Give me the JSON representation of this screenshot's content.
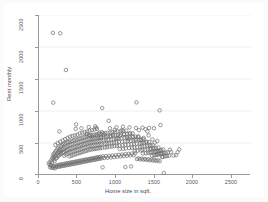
{
  "chart_data": {
    "type": "scatter",
    "title": "",
    "xlabel": "Home size in sqft.",
    "ylabel": "Rent monthly",
    "xlim": [
      0,
      2600
    ],
    "ylim": [
      0,
      2500
    ],
    "xticks": [
      0,
      500,
      1000,
      1500,
      2000,
      2500
    ],
    "yticks": [
      0,
      500,
      1000,
      1500,
      2000,
      2500
    ],
    "xtick_labels": [
      "0",
      "500",
      "1000",
      "1500",
      "2000",
      "2500"
    ],
    "ytick_labels": [
      "0",
      "500",
      "1000",
      "1500",
      "2000",
      "2500"
    ],
    "grid": "horizontal",
    "legend": "none",
    "marker": "open-circle",
    "marker_color": "#6d6d6d",
    "background_color": "#ffffff",
    "axis_color": "#9a9a9a",
    "grid_color": "#e8e8e8",
    "n_points": 432,
    "points": [
      [
        170,
        2220
      ],
      [
        260,
        2215
      ],
      [
        330,
        1640
      ],
      [
        175,
        1130
      ],
      [
        775,
        1045
      ],
      [
        1195,
        1135
      ],
      [
        1480,
        1010
      ],
      [
        1490,
        780
      ],
      [
        455,
        790
      ],
      [
        700,
        740
      ],
      [
        855,
        845
      ],
      [
        930,
        705
      ],
      [
        1015,
        700
      ],
      [
        1120,
        655
      ],
      [
        1225,
        700
      ],
      [
        1305,
        715
      ],
      [
        1330,
        680
      ],
      [
        1345,
        620
      ],
      [
        585,
        640
      ],
      [
        620,
        620
      ],
      [
        650,
        600
      ],
      [
        705,
        615
      ],
      [
        760,
        585
      ],
      [
        800,
        625
      ],
      [
        870,
        600
      ],
      [
        905,
        630
      ],
      [
        960,
        575
      ],
      [
        995,
        610
      ],
      [
        1040,
        640
      ],
      [
        1075,
        590
      ],
      [
        1100,
        560
      ],
      [
        1145,
        600
      ],
      [
        1180,
        555
      ],
      [
        1215,
        590
      ],
      [
        1250,
        545
      ],
      [
        1285,
        580
      ],
      [
        1320,
        520
      ],
      [
        1390,
        555
      ],
      [
        1420,
        505
      ],
      [
        1450,
        530
      ],
      [
        1525,
        400
      ],
      [
        1605,
        395
      ],
      [
        1720,
        400
      ],
      [
        1530,
        30
      ],
      [
        780,
        120
      ],
      [
        1060,
        125
      ],
      [
        1130,
        135
      ],
      [
        120,
        175
      ],
      [
        130,
        200
      ],
      [
        140,
        160
      ],
      [
        150,
        230
      ],
      [
        160,
        195
      ],
      [
        165,
        265
      ],
      [
        170,
        300
      ],
      [
        175,
        240
      ],
      [
        180,
        330
      ],
      [
        185,
        280
      ],
      [
        190,
        215
      ],
      [
        195,
        355
      ],
      [
        200,
        300
      ],
      [
        205,
        255
      ],
      [
        210,
        380
      ],
      [
        215,
        320
      ],
      [
        220,
        270
      ],
      [
        225,
        410
      ],
      [
        230,
        345
      ],
      [
        235,
        295
      ],
      [
        240,
        430
      ],
      [
        245,
        365
      ],
      [
        250,
        310
      ],
      [
        255,
        395
      ],
      [
        260,
        340
      ],
      [
        265,
        450
      ],
      [
        270,
        385
      ],
      [
        275,
        330
      ],
      [
        280,
        465
      ],
      [
        285,
        400
      ],
      [
        290,
        350
      ],
      [
        295,
        480
      ],
      [
        300,
        415
      ],
      [
        305,
        360
      ],
      [
        310,
        300
      ],
      [
        315,
        490
      ],
      [
        320,
        430
      ],
      [
        325,
        375
      ],
      [
        330,
        320
      ],
      [
        335,
        505
      ],
      [
        340,
        445
      ],
      [
        345,
        390
      ],
      [
        350,
        335
      ],
      [
        355,
        515
      ],
      [
        360,
        460
      ],
      [
        365,
        405
      ],
      [
        370,
        350
      ],
      [
        375,
        290
      ],
      [
        380,
        525
      ],
      [
        385,
        470
      ],
      [
        390,
        415
      ],
      [
        395,
        360
      ],
      [
        400,
        300
      ],
      [
        405,
        535
      ],
      [
        410,
        480
      ],
      [
        415,
        425
      ],
      [
        420,
        370
      ],
      [
        425,
        315
      ],
      [
        430,
        545
      ],
      [
        435,
        490
      ],
      [
        440,
        435
      ],
      [
        445,
        380
      ],
      [
        450,
        325
      ],
      [
        455,
        555
      ],
      [
        460,
        500
      ],
      [
        465,
        445
      ],
      [
        470,
        390
      ],
      [
        475,
        335
      ],
      [
        480,
        565
      ],
      [
        485,
        510
      ],
      [
        490,
        455
      ],
      [
        495,
        400
      ],
      [
        500,
        345
      ],
      [
        505,
        575
      ],
      [
        510,
        520
      ],
      [
        515,
        465
      ],
      [
        520,
        410
      ],
      [
        525,
        355
      ],
      [
        530,
        585
      ],
      [
        535,
        530
      ],
      [
        540,
        475
      ],
      [
        545,
        420
      ],
      [
        550,
        365
      ],
      [
        555,
        595
      ],
      [
        560,
        540
      ],
      [
        565,
        485
      ],
      [
        570,
        430
      ],
      [
        575,
        375
      ],
      [
        580,
        605
      ],
      [
        585,
        550
      ],
      [
        590,
        495
      ],
      [
        595,
        440
      ],
      [
        600,
        385
      ],
      [
        605,
        615
      ],
      [
        610,
        560
      ],
      [
        615,
        505
      ],
      [
        620,
        450
      ],
      [
        625,
        395
      ],
      [
        630,
        620
      ],
      [
        635,
        565
      ],
      [
        640,
        510
      ],
      [
        645,
        455
      ],
      [
        650,
        400
      ],
      [
        655,
        625
      ],
      [
        660,
        570
      ],
      [
        665,
        515
      ],
      [
        670,
        460
      ],
      [
        675,
        405
      ],
      [
        680,
        630
      ],
      [
        685,
        575
      ],
      [
        690,
        520
      ],
      [
        695,
        465
      ],
      [
        700,
        410
      ],
      [
        705,
        635
      ],
      [
        710,
        580
      ],
      [
        715,
        525
      ],
      [
        720,
        470
      ],
      [
        725,
        415
      ],
      [
        730,
        640
      ],
      [
        735,
        585
      ],
      [
        740,
        530
      ],
      [
        745,
        475
      ],
      [
        750,
        420
      ],
      [
        755,
        645
      ],
      [
        760,
        590
      ],
      [
        765,
        535
      ],
      [
        770,
        480
      ],
      [
        775,
        425
      ],
      [
        785,
        650
      ],
      [
        790,
        595
      ],
      [
        795,
        540
      ],
      [
        805,
        485
      ],
      [
        810,
        430
      ],
      [
        815,
        655
      ],
      [
        820,
        600
      ],
      [
        825,
        545
      ],
      [
        830,
        490
      ],
      [
        835,
        435
      ],
      [
        840,
        660
      ],
      [
        845,
        605
      ],
      [
        850,
        550
      ],
      [
        860,
        495
      ],
      [
        865,
        440
      ],
      [
        875,
        665
      ],
      [
        880,
        610
      ],
      [
        885,
        555
      ],
      [
        890,
        500
      ],
      [
        895,
        445
      ],
      [
        900,
        670
      ],
      [
        910,
        615
      ],
      [
        915,
        560
      ],
      [
        920,
        505
      ],
      [
        925,
        450
      ],
      [
        935,
        675
      ],
      [
        940,
        620
      ],
      [
        945,
        565
      ],
      [
        950,
        510
      ],
      [
        955,
        455
      ],
      [
        965,
        680
      ],
      [
        970,
        625
      ],
      [
        975,
        570
      ],
      [
        980,
        515
      ],
      [
        985,
        460
      ],
      [
        990,
        405
      ],
      [
        1000,
        685
      ],
      [
        1005,
        630
      ],
      [
        1010,
        575
      ],
      [
        1020,
        520
      ],
      [
        1025,
        465
      ],
      [
        1030,
        410
      ],
      [
        1035,
        690
      ],
      [
        1045,
        635
      ],
      [
        1050,
        580
      ],
      [
        1055,
        525
      ],
      [
        1060,
        470
      ],
      [
        1065,
        415
      ],
      [
        1070,
        695
      ],
      [
        1080,
        640
      ],
      [
        1085,
        585
      ],
      [
        1090,
        530
      ],
      [
        1095,
        475
      ],
      [
        1105,
        420
      ],
      [
        1110,
        645
      ],
      [
        1115,
        590
      ],
      [
        1125,
        535
      ],
      [
        1135,
        480
      ],
      [
        1140,
        425
      ],
      [
        1150,
        650
      ],
      [
        1155,
        595
      ],
      [
        1160,
        540
      ],
      [
        1165,
        485
      ],
      [
        1170,
        430
      ],
      [
        1175,
        375
      ],
      [
        1185,
        600
      ],
      [
        1190,
        545
      ],
      [
        1200,
        490
      ],
      [
        1205,
        435
      ],
      [
        1210,
        380
      ],
      [
        1220,
        605
      ],
      [
        1230,
        550
      ],
      [
        1235,
        495
      ],
      [
        1240,
        440
      ],
      [
        1245,
        385
      ],
      [
        1255,
        555
      ],
      [
        1260,
        500
      ],
      [
        1265,
        445
      ],
      [
        1270,
        390
      ],
      [
        1275,
        335
      ],
      [
        1280,
        560
      ],
      [
        1290,
        505
      ],
      [
        1295,
        450
      ],
      [
        1300,
        395
      ],
      [
        1310,
        340
      ],
      [
        1315,
        510
      ],
      [
        1325,
        455
      ],
      [
        1335,
        400
      ],
      [
        1340,
        345
      ],
      [
        1350,
        515
      ],
      [
        1355,
        460
      ],
      [
        1360,
        405
      ],
      [
        1365,
        350
      ],
      [
        1370,
        465
      ],
      [
        1375,
        410
      ],
      [
        1380,
        355
      ],
      [
        1385,
        300
      ],
      [
        1395,
        470
      ],
      [
        1400,
        415
      ],
      [
        1405,
        360
      ],
      [
        1410,
        305
      ],
      [
        1415,
        420
      ],
      [
        1425,
        365
      ],
      [
        1430,
        310
      ],
      [
        1435,
        425
      ],
      [
        1440,
        370
      ],
      [
        1445,
        315
      ],
      [
        1455,
        375
      ],
      [
        1460,
        320
      ],
      [
        1465,
        430
      ],
      [
        1470,
        380
      ],
      [
        1475,
        325
      ],
      [
        1485,
        385
      ],
      [
        1495,
        330
      ],
      [
        1500,
        390
      ],
      [
        1505,
        335
      ],
      [
        1510,
        280
      ],
      [
        1515,
        340
      ],
      [
        1520,
        285
      ],
      [
        1535,
        345
      ],
      [
        1545,
        290
      ],
      [
        1555,
        350
      ],
      [
        1570,
        295
      ],
      [
        1580,
        355
      ],
      [
        1595,
        300
      ],
      [
        1620,
        360
      ],
      [
        1650,
        305
      ],
      [
        1680,
        310
      ],
      [
        1700,
        355
      ],
      [
        135,
        120
      ],
      [
        145,
        145
      ],
      [
        155,
        115
      ],
      [
        165,
        140
      ],
      [
        175,
        110
      ],
      [
        185,
        135
      ],
      [
        195,
        105
      ],
      [
        205,
        130
      ],
      [
        215,
        150
      ],
      [
        225,
        125
      ],
      [
        235,
        155
      ],
      [
        245,
        130
      ],
      [
        255,
        160
      ],
      [
        265,
        135
      ],
      [
        275,
        165
      ],
      [
        285,
        140
      ],
      [
        295,
        170
      ],
      [
        305,
        145
      ],
      [
        315,
        175
      ],
      [
        325,
        150
      ],
      [
        335,
        180
      ],
      [
        345,
        155
      ],
      [
        355,
        185
      ],
      [
        365,
        160
      ],
      [
        375,
        190
      ],
      [
        385,
        165
      ],
      [
        395,
        195
      ],
      [
        405,
        170
      ],
      [
        415,
        200
      ],
      [
        425,
        175
      ],
      [
        435,
        205
      ],
      [
        445,
        180
      ],
      [
        455,
        210
      ],
      [
        465,
        185
      ],
      [
        475,
        215
      ],
      [
        485,
        190
      ],
      [
        495,
        220
      ],
      [
        505,
        195
      ],
      [
        515,
        225
      ],
      [
        525,
        200
      ],
      [
        535,
        230
      ],
      [
        545,
        205
      ],
      [
        555,
        235
      ],
      [
        565,
        210
      ],
      [
        575,
        240
      ],
      [
        585,
        215
      ],
      [
        595,
        245
      ],
      [
        605,
        220
      ],
      [
        615,
        250
      ],
      [
        625,
        225
      ],
      [
        635,
        255
      ],
      [
        645,
        230
      ],
      [
        655,
        260
      ],
      [
        665,
        235
      ],
      [
        675,
        265
      ],
      [
        685,
        240
      ],
      [
        695,
        270
      ],
      [
        705,
        245
      ],
      [
        715,
        275
      ],
      [
        725,
        250
      ],
      [
        735,
        280
      ],
      [
        745,
        255
      ],
      [
        755,
        285
      ],
      [
        765,
        260
      ],
      [
        785,
        290
      ],
      [
        800,
        265
      ],
      [
        820,
        295
      ],
      [
        840,
        270
      ],
      [
        860,
        300
      ],
      [
        880,
        275
      ],
      [
        900,
        305
      ],
      [
        920,
        280
      ],
      [
        940,
        310
      ],
      [
        960,
        285
      ],
      [
        980,
        315
      ],
      [
        1000,
        290
      ],
      [
        1020,
        320
      ],
      [
        1040,
        295
      ],
      [
        1060,
        325
      ],
      [
        1080,
        300
      ],
      [
        1100,
        330
      ],
      [
        1120,
        305
      ],
      [
        1140,
        335
      ],
      [
        1160,
        310
      ],
      [
        1180,
        340
      ],
      [
        1200,
        250
      ],
      [
        1220,
        260
      ],
      [
        1240,
        245
      ],
      [
        1260,
        255
      ],
      [
        1280,
        240
      ],
      [
        1300,
        250
      ],
      [
        1320,
        235
      ],
      [
        1340,
        245
      ],
      [
        1360,
        230
      ],
      [
        1380,
        240
      ],
      [
        1400,
        225
      ],
      [
        1420,
        235
      ],
      [
        1440,
        220
      ],
      [
        1460,
        230
      ],
      [
        1480,
        215
      ],
      [
        200,
        470
      ],
      [
        230,
        500
      ],
      [
        260,
        520
      ],
      [
        290,
        540
      ],
      [
        320,
        560
      ],
      [
        350,
        580
      ],
      [
        380,
        600
      ],
      [
        410,
        610
      ],
      [
        440,
        620
      ],
      [
        470,
        630
      ],
      [
        500,
        650
      ],
      [
        530,
        660
      ],
      [
        560,
        670
      ],
      [
        590,
        680
      ],
      [
        620,
        690
      ],
      [
        650,
        700
      ],
      [
        680,
        710
      ],
      [
        710,
        720
      ],
      [
        740,
        660
      ],
      [
        770,
        670
      ],
      [
        250,
        680
      ],
      [
        450,
        720
      ],
      [
        520,
        730
      ],
      [
        610,
        750
      ],
      [
        690,
        760
      ],
      [
        870,
        730
      ],
      [
        950,
        745
      ],
      [
        1030,
        755
      ],
      [
        1110,
        745
      ],
      [
        1190,
        735
      ],
      [
        1270,
        740
      ],
      [
        1350,
        735
      ],
      [
        1410,
        730
      ]
    ]
  }
}
